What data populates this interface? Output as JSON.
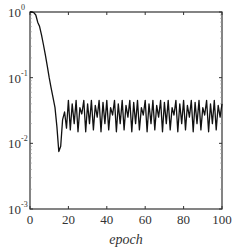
{
  "chart_data": {
    "type": "line",
    "title": "",
    "xlabel": "epoch",
    "ylabel": "",
    "xlim": [
      0,
      100
    ],
    "ylim": [
      0.001,
      1
    ],
    "yscale": "log",
    "grid": false,
    "legend": null,
    "x_ticks": [
      0,
      20,
      40,
      60,
      80,
      100
    ],
    "x_tick_labels": [
      "0",
      "20",
      "40",
      "60",
      "80",
      "100"
    ],
    "y_ticks": [
      1,
      0.1,
      0.01,
      0.001
    ],
    "y_tick_labels": [
      {
        "base": "10",
        "exp": "0"
      },
      {
        "base": "10",
        "exp": "-1"
      },
      {
        "base": "10",
        "exp": "-2"
      },
      {
        "base": "10",
        "exp": "-3"
      }
    ],
    "series": [
      {
        "name": "loss",
        "color": "#111111",
        "x": [
          0,
          1,
          2,
          3,
          4,
          5,
          6,
          7,
          8,
          9,
          10,
          11,
          12,
          13,
          14,
          15,
          16,
          17,
          18,
          19,
          20,
          21,
          22,
          23,
          24,
          25,
          26,
          27,
          28,
          29,
          30,
          31,
          32,
          33,
          34,
          35,
          36,
          37,
          38,
          39,
          40,
          41,
          42,
          43,
          44,
          45,
          46,
          47,
          48,
          49,
          50,
          51,
          52,
          53,
          54,
          55,
          56,
          57,
          58,
          59,
          60,
          61,
          62,
          63,
          64,
          65,
          66,
          67,
          68,
          69,
          70,
          71,
          72,
          73,
          74,
          75,
          76,
          77,
          78,
          79,
          80,
          81,
          82,
          83,
          84,
          85,
          86,
          87,
          88,
          89,
          90,
          91,
          92,
          93,
          94,
          95,
          96,
          97,
          98,
          99,
          100
        ],
        "values": [
          1.0,
          1.0,
          0.98,
          0.9,
          0.7,
          0.6,
          0.45,
          0.32,
          0.22,
          0.15,
          0.1,
          0.07,
          0.05,
          0.035,
          0.018,
          0.0075,
          0.009,
          0.023,
          0.03,
          0.017,
          0.045,
          0.016,
          0.04,
          0.02,
          0.045,
          0.015,
          0.035,
          0.028,
          0.045,
          0.015,
          0.04,
          0.02,
          0.045,
          0.016,
          0.038,
          0.025,
          0.045,
          0.015,
          0.042,
          0.02,
          0.045,
          0.016,
          0.035,
          0.027,
          0.045,
          0.015,
          0.04,
          0.02,
          0.045,
          0.016,
          0.038,
          0.025,
          0.045,
          0.015,
          0.042,
          0.02,
          0.045,
          0.016,
          0.035,
          0.027,
          0.045,
          0.015,
          0.04,
          0.02,
          0.045,
          0.016,
          0.038,
          0.025,
          0.045,
          0.015,
          0.042,
          0.02,
          0.045,
          0.016,
          0.035,
          0.027,
          0.045,
          0.015,
          0.04,
          0.02,
          0.045,
          0.016,
          0.038,
          0.025,
          0.045,
          0.015,
          0.042,
          0.02,
          0.045,
          0.016,
          0.035,
          0.027,
          0.045,
          0.015,
          0.04,
          0.02,
          0.045,
          0.016,
          0.038,
          0.025,
          0.04
        ]
      }
    ]
  },
  "labels": {
    "xlabel": "epoch"
  }
}
